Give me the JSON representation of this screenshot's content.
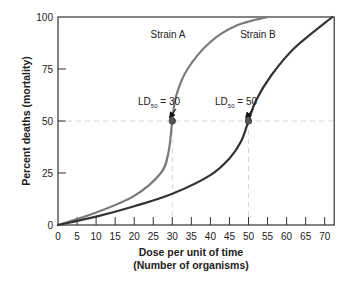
{
  "chart_data": {
    "type": "line",
    "title": "",
    "xlabel": "Dose per unit of time",
    "xlabel_line2": "(Number of organisms)",
    "ylabel": "Percent deaths (mortality)",
    "xlim": [
      0,
      72.5
    ],
    "ylim": [
      0,
      100
    ],
    "x_ticks": [
      0,
      5,
      10,
      15,
      20,
      25,
      30,
      35,
      40,
      45,
      50,
      55,
      60,
      65,
      70
    ],
    "y_ticks": [
      0,
      25,
      50,
      75,
      100
    ],
    "grid": false,
    "legend": "inline labels on curves",
    "series": [
      {
        "name": "Strain A",
        "color": "#7a7a7a",
        "x": [
          0,
          10,
          20,
          27,
          29,
          30,
          31,
          34,
          40,
          47,
          55
        ],
        "y": [
          0,
          6,
          14,
          25,
          35,
          50,
          62,
          75,
          88,
          96,
          100
        ]
      },
      {
        "name": "Strain B",
        "color": "#333333",
        "x": [
          0,
          10,
          20,
          30,
          40,
          45,
          48,
          50,
          52,
          56,
          62,
          72
        ],
        "y": [
          0,
          4,
          9,
          15,
          24,
          32,
          40,
          50,
          60,
          72,
          85,
          100
        ]
      }
    ],
    "annotations": [
      {
        "text": "LD50 = 30",
        "main": "LD",
        "sub": "50",
        "suffix": " = 30",
        "x": 30,
        "y": 50
      },
      {
        "text": "LD50 = 50",
        "main": "LD",
        "sub": "50",
        "suffix": " = 50",
        "x": 50,
        "y": 50
      }
    ],
    "reference_lines": [
      {
        "type": "horizontal",
        "y": 50,
        "style": "dashed"
      },
      {
        "type": "vertical",
        "x": 30,
        "style": "dashed"
      },
      {
        "type": "vertical",
        "x": 50,
        "style": "dashed"
      }
    ]
  }
}
